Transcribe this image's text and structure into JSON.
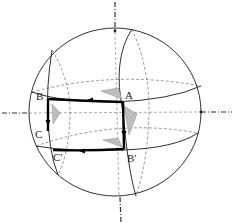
{
  "figure": {
    "type": "sphere-parallel-transport-diagram",
    "labels": {
      "A": "A",
      "B": "B",
      "C": "C",
      "B_prime": "B′",
      "C_prime": "C′"
    },
    "path": [
      "A",
      "B",
      "C",
      "C′",
      "B′",
      "A"
    ],
    "colors": {
      "line": "#1a1a1a",
      "path": "#000000",
      "axis": "#333333",
      "hidden": "#555555",
      "shade": "#bdbdbd"
    }
  }
}
